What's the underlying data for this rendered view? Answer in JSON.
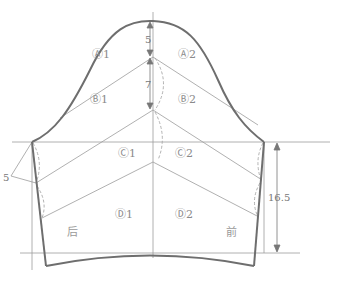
{
  "diagram": {
    "type": "sleeve-pattern-draft",
    "regions": {
      "A1": "Ⓐ1",
      "A2": "Ⓐ2",
      "B1": "Ⓑ1",
      "B2": "Ⓑ2",
      "C1": "Ⓒ1",
      "C2": "Ⓒ2",
      "D1": "Ⓓ1",
      "D2": "Ⓓ2"
    },
    "side_labels": {
      "back": "后",
      "front": "前"
    },
    "dimensions": {
      "cap_top": "5",
      "cap_mid": "7",
      "left_offset": "5",
      "underarm_length": "16.5"
    },
    "colors": {
      "outline": "#6e6e6e",
      "guide": "#9c9c9c",
      "dashed": "#a8a8a8",
      "text": "#8a8a8a"
    }
  }
}
